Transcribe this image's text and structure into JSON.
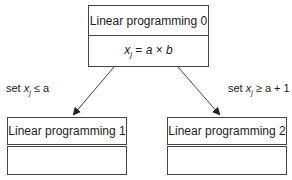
{
  "root": {
    "title": "Linear programming 0",
    "constraint": {
      "var": "x",
      "sub": "j",
      "rest": " = ",
      "a": "a",
      "op": " × ",
      "b": "b"
    }
  },
  "left_child": {
    "title": "Linear programming 1",
    "branch_label": {
      "prefix": "set ",
      "var": "x",
      "sub": "j",
      "rest": " ≤ a"
    }
  },
  "right_child": {
    "title": "Linear programming 2",
    "branch_label": {
      "prefix": "set ",
      "var": "x",
      "sub": "j",
      "rest": " ≥ a + 1"
    }
  },
  "colors": {
    "stroke": "#444444",
    "text": "#222222"
  }
}
